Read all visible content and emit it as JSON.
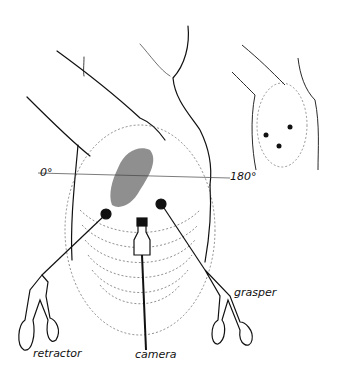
{
  "figure": {
    "labels": {
      "angle_left": "0°",
      "angle_right": "180°",
      "retractor": "retractor",
      "camera": "camera",
      "grasper": "grasper"
    },
    "inset": {
      "port_marks": 3
    },
    "colors": {
      "ink": "#111111",
      "background": "#ffffff"
    }
  }
}
